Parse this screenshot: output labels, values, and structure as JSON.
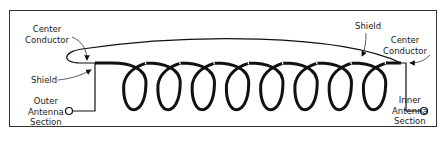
{
  "diagram": {
    "labels": {
      "left_center_conductor": [
        "Center",
        "Conductor"
      ],
      "left_shield": "Shield",
      "outer_section": [
        "Outer",
        "Antenna",
        "Section"
      ],
      "right_shield": "Shield",
      "right_center_conductor": [
        "Center",
        "Conductor"
      ],
      "inner_section": [
        "Inner",
        "Antenna",
        "Section"
      ]
    },
    "coil": {
      "turns": 8
    },
    "colors": {
      "line": "#111111",
      "border": "#333333",
      "background": "#ffffff"
    }
  }
}
